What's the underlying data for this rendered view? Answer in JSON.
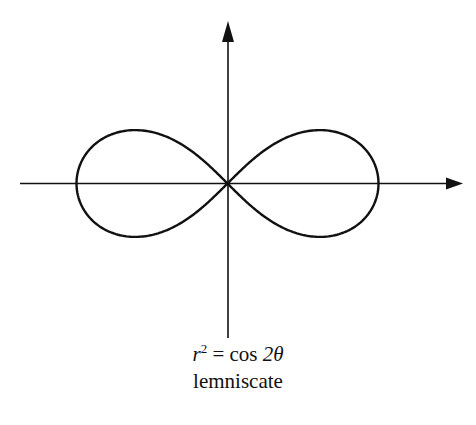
{
  "diagram": {
    "type": "polar-curve",
    "equation": {
      "lhs_var": "r",
      "lhs_exp": "2",
      "equals": "=",
      "rhs": "cos 2θ",
      "rhs_func": "cos",
      "rhs_arg": "2θ"
    },
    "name": "lemniscate",
    "colors": {
      "stroke": "#111111",
      "background": "#ffffff"
    },
    "axes": {
      "x_axis": {
        "has_arrow": true,
        "direction": "right"
      },
      "y_axis": {
        "has_arrow": true,
        "direction": "up"
      }
    }
  }
}
